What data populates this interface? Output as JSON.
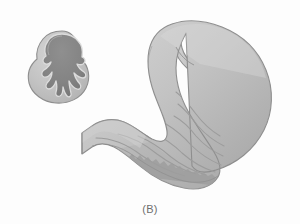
{
  "figure": {
    "panel_label": "(B)",
    "style": "grayscale-medical-line-art",
    "background_color": "#fdfdfd",
    "canvas": {
      "width": 300,
      "height": 224
    }
  },
  "palette": {
    "background": "#fdfdfd",
    "outline": "#8e8e8e",
    "outline_dark": "#7a7a7a",
    "wall_light": "#c9c9c9",
    "wall_mid": "#b6b6b6",
    "wall_shadow": "#a3a3a3",
    "lumen_dark": "#8a8a8a",
    "lumen_darkest": "#767676",
    "rugae_line": "#9a9a9a",
    "highlight": "#d8d8d8",
    "caption_text": "#6e6e6e"
  },
  "inset": {
    "name": "cross-section-inset",
    "description": "Transverse cross-section through the stomach wall showing the collapsed stellate lumen surrounded by mucosal rugae and the muscular wall.",
    "center": {
      "x": 62,
      "y": 62
    },
    "outer_radius": 31,
    "wall_color": "#c2c2c2",
    "wall_outline": "#8e8e8e",
    "lumen_color": "#8a8a8a",
    "rugae_outline": "#dcdcdc",
    "lobe_count": 9
  },
  "stomach": {
    "name": "stomach-body",
    "description": "Anterior view of the stomach with esophagus entering superiorly, fundus and body forming the large curved sac, antrum and pylorus narrowing toward the duodenum which exits at the left.",
    "fill_light": "#c9c9c9",
    "fill_mid": "#b8b8b8",
    "fill_shadow": "#a6a6a6",
    "outline": "#8e8e8e",
    "parts": [
      {
        "id": "esophagus",
        "label": "Esophagus",
        "interactable": false
      },
      {
        "id": "cardia",
        "label": "Cardia",
        "interactable": false
      },
      {
        "id": "fundus",
        "label": "Fundus",
        "interactable": false
      },
      {
        "id": "body",
        "label": "Body",
        "interactable": false
      },
      {
        "id": "greater-curvature",
        "label": "Greater curvature",
        "interactable": false
      },
      {
        "id": "lesser-curvature",
        "label": "Lesser curvature",
        "interactable": false
      },
      {
        "id": "antrum",
        "label": "Pyloric antrum",
        "interactable": false
      },
      {
        "id": "pylorus",
        "label": "Pylorus",
        "interactable": false
      },
      {
        "id": "duodenum",
        "label": "Duodenum",
        "interactable": false
      },
      {
        "id": "rugae",
        "label": "Rugae (mucosal folds)",
        "interactable": false
      },
      {
        "id": "serrated-margin",
        "label": "Serrated inner margin of greater curvature",
        "interactable": false
      }
    ],
    "rugae_count": 8,
    "serration_teeth": 28
  }
}
